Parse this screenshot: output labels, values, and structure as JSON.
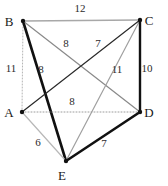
{
  "figure": {
    "width": 168,
    "height": 186,
    "background": "#ffffff"
  },
  "chart_data": {
    "type": "diagram",
    "subtype": "weighted-graph",
    "title": "",
    "nodes": [
      {
        "id": "A",
        "label": "A",
        "x": 22,
        "y": 112,
        "label_x": 9,
        "label_y": 117
      },
      {
        "id": "B",
        "label": "B",
        "x": 23,
        "y": 21,
        "label_x": 9,
        "label_y": 26
      },
      {
        "id": "C",
        "label": "C",
        "x": 140,
        "y": 20,
        "label_x": 149,
        "label_y": 25
      },
      {
        "id": "D",
        "label": "D",
        "x": 140,
        "y": 112,
        "label_x": 149,
        "label_y": 117
      },
      {
        "id": "E",
        "label": "E",
        "x": 66,
        "y": 161,
        "label_x": 62,
        "label_y": 180
      }
    ],
    "edges": [
      {
        "id": "BC",
        "from": "B",
        "to": "C",
        "weight": "12",
        "style": "solid",
        "emphasis": "light",
        "color": "#a8a8a8",
        "width": 1.6,
        "label_x": 80,
        "label_y": 12
      },
      {
        "id": "AB",
        "from": "A",
        "to": "B",
        "weight": "11",
        "style": "dotted",
        "emphasis": "light",
        "color": "#b5b5b5",
        "width": 1.0,
        "label_x": 11,
        "label_y": 72
      },
      {
        "id": "BE",
        "from": "B",
        "to": "E",
        "weight": "8",
        "style": "solid",
        "emphasis": "bold",
        "color": "#111111",
        "width": 2.6,
        "label_x": 41,
        "label_y": 73
      },
      {
        "id": "BD",
        "from": "B",
        "to": "D",
        "weight": "8",
        "style": "solid",
        "emphasis": "medium",
        "color": "#8a8a8a",
        "width": 1.2,
        "label_x": 66,
        "label_y": 47
      },
      {
        "id": "CE",
        "from": "C",
        "to": "E",
        "weight": "7",
        "style": "solid",
        "emphasis": "light",
        "color": "#a0a0a0",
        "width": 1.2,
        "label_x": 98,
        "label_y": 47
      },
      {
        "id": "CA",
        "from": "C",
        "to": "A",
        "weight": "11",
        "style": "solid",
        "emphasis": "dark",
        "color": "#2a2a2a",
        "width": 1.2,
        "label_x": 117,
        "label_y": 73
      },
      {
        "id": "CD",
        "from": "C",
        "to": "D",
        "weight": "10",
        "style": "solid",
        "emphasis": "bold",
        "color": "#111111",
        "width": 2.4,
        "label_x": 147,
        "label_y": 72
      },
      {
        "id": "AD",
        "from": "A",
        "to": "D",
        "weight": "8",
        "style": "dotted",
        "emphasis": "light",
        "color": "#9c9c9c",
        "width": 1.0,
        "label_x": 72,
        "label_y": 105
      },
      {
        "id": "AE",
        "from": "A",
        "to": "E",
        "weight": "6",
        "style": "solid",
        "emphasis": "light",
        "color": "#b8b8b8",
        "width": 1.2,
        "label_x": 38,
        "label_y": 146
      },
      {
        "id": "DE",
        "from": "D",
        "to": "E",
        "weight": "7",
        "style": "solid",
        "emphasis": "bold",
        "color": "#111111",
        "width": 2.6,
        "label_x": 104,
        "label_y": 147
      }
    ],
    "node_count": 5,
    "edge_count": 10,
    "weights": [
      "12",
      "11",
      "8",
      "8",
      "7",
      "11",
      "10",
      "8",
      "6",
      "7"
    ]
  }
}
